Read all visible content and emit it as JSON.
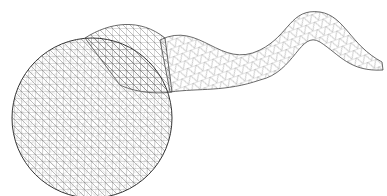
{
  "figure": {
    "background": "#ffffff",
    "stroke_color": "#555555",
    "parts": [
      "spherical head",
      "wavy tail"
    ]
  }
}
